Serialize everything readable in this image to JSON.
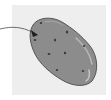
{
  "figure": {
    "callout_target": "potato eye",
    "colors": {
      "background": "#ffffff",
      "panel": "#eeeeee",
      "potato_fill": "#8c8c8c",
      "potato_outline": "#555555",
      "highlight": "#b8b8b8",
      "eye": "#3a3a3a",
      "pointer": "#333333"
    }
  }
}
